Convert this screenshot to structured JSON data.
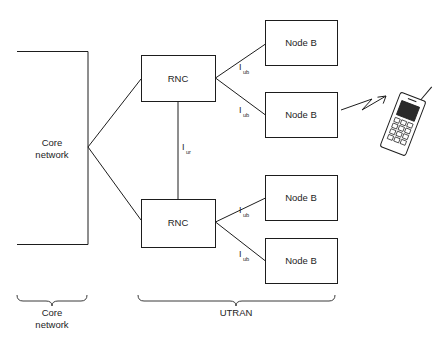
{
  "diagram": {
    "stroke_color": "#1d1d1d",
    "background_color": "#ffffff",
    "nodes": {
      "core_network": {
        "label_line1": "Core",
        "label_line2": "network"
      },
      "rnc_top": {
        "label": "RNC"
      },
      "rnc_bottom": {
        "label": "RNC"
      },
      "node_b_1": {
        "label": "Node B"
      },
      "node_b_2": {
        "label": "Node B"
      },
      "node_b_3": {
        "label": "Node B"
      },
      "node_b_4": {
        "label": "Node B"
      },
      "mobile_station": {
        "label": ""
      }
    },
    "interfaces": {
      "iur": {
        "base": "I",
        "sub": "ur"
      },
      "iub_1": {
        "base": "I",
        "sub": "ub"
      },
      "iub_2": {
        "base": "I",
        "sub": "ub"
      },
      "iub_3": {
        "base": "I",
        "sub": "ub"
      },
      "iub_4": {
        "base": "I",
        "sub": "ub"
      }
    },
    "groups": {
      "core_brace": {
        "label_line1": "Core",
        "label_line2": "network"
      },
      "utran_brace": {
        "label": "UTRAN"
      }
    }
  }
}
